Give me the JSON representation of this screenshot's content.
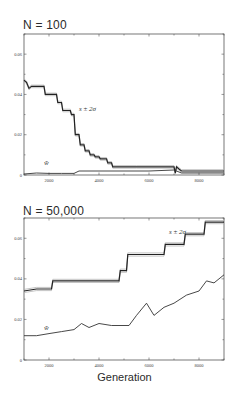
{
  "chart_data": [
    {
      "type": "line",
      "title": "N = 100",
      "xlabel": "",
      "ylabel": "",
      "xlim": [
        1000,
        9000
      ],
      "ylim": [
        0,
        0.07
      ],
      "xticks": [
        2000,
        4000,
        6000,
        8000
      ],
      "yticks": [
        0,
        0.02,
        0.04,
        0.06
      ],
      "xtick_labels": [
        "2000",
        "4000",
        "6000",
        "8000"
      ],
      "ytick_labels": [
        "0",
        "0.02",
        "0.04",
        "0.06"
      ],
      "grid": false,
      "annotations": [
        {
          "text": "s ± 2σ",
          "x": 3200,
          "y": 0.032
        },
        {
          "text": "w̄",
          "x": 1800,
          "y": 0.005
        }
      ],
      "series": [
        {
          "name": "s ± 2σ",
          "x": [
            1000,
            1100,
            1200,
            1300,
            1800,
            1850,
            2300,
            2350,
            2500,
            2550,
            2850,
            2900,
            3000,
            3050,
            3200,
            3250,
            3400,
            3450,
            3600,
            3650,
            3800,
            3850,
            4000,
            4050,
            4300,
            4350,
            4500,
            4550,
            5500,
            5600,
            7000,
            7050,
            7100,
            7200,
            7300,
            9000
          ],
          "values": [
            0.047,
            0.046,
            0.043,
            0.044,
            0.044,
            0.04,
            0.04,
            0.036,
            0.036,
            0.032,
            0.032,
            0.03,
            0.03,
            0.02,
            0.02,
            0.015,
            0.015,
            0.012,
            0.012,
            0.01,
            0.01,
            0.009,
            0.009,
            0.008,
            0.008,
            0.006,
            0.006,
            0.004,
            0.004,
            0.004,
            0.004,
            0.001,
            0.004,
            0.003,
            0.002,
            0.002
          ]
        },
        {
          "name": "w̄",
          "x": [
            1000,
            1500,
            2000,
            2500,
            3000,
            3200,
            4000,
            5000,
            6000,
            7000,
            7300,
            9000
          ],
          "values": [
            0.0005,
            0.001,
            0.0008,
            0.0008,
            0.0008,
            0.002,
            0.002,
            0.002,
            0.002,
            0.0025,
            0.001,
            0.001
          ]
        }
      ]
    },
    {
      "type": "line",
      "title": "N = 50,000",
      "xlabel": "Generation",
      "ylabel": "",
      "xlim": [
        1000,
        9000
      ],
      "ylim": [
        0,
        0.07
      ],
      "xticks": [
        2000,
        4000,
        6000,
        8000
      ],
      "yticks": [
        0,
        0.02,
        0.04,
        0.06
      ],
      "xtick_labels": [
        "2000",
        "4000",
        "6000",
        "8000"
      ],
      "ytick_labels": [
        "0",
        "0.02",
        "0.04",
        "0.06"
      ],
      "grid": false,
      "annotations": [
        {
          "text": "s ± 2σ",
          "x": 6800,
          "y": 0.062
        },
        {
          "text": "w̄",
          "x": 1800,
          "y": 0.015
        }
      ],
      "series": [
        {
          "name": "s ± 2σ",
          "x": [
            1000,
            1500,
            2100,
            2150,
            4800,
            4850,
            5100,
            5150,
            6600,
            6650,
            7400,
            7450,
            8200,
            8250,
            9000
          ],
          "values": [
            0.034,
            0.035,
            0.035,
            0.039,
            0.039,
            0.044,
            0.044,
            0.052,
            0.052,
            0.057,
            0.057,
            0.062,
            0.062,
            0.068,
            0.068
          ]
        },
        {
          "name": "w̄",
          "x": [
            1000,
            1500,
            2000,
            2500,
            3000,
            3300,
            3600,
            4000,
            4500,
            4800,
            5200,
            5500,
            5900,
            6200,
            6600,
            7000,
            7500,
            8000,
            8300,
            8600,
            9000
          ],
          "values": [
            0.012,
            0.012,
            0.013,
            0.014,
            0.015,
            0.018,
            0.016,
            0.018,
            0.017,
            0.017,
            0.017,
            0.022,
            0.028,
            0.022,
            0.026,
            0.028,
            0.032,
            0.034,
            0.039,
            0.038,
            0.042
          ]
        }
      ]
    }
  ],
  "panels": {
    "top_title": "N = 100",
    "bottom_title": "N = 50,000",
    "xlabel": "Generation"
  }
}
